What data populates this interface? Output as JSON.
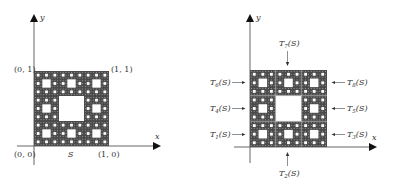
{
  "left_figure": {
    "axis_x_label": "x",
    "axis_y_label": "y",
    "corner_labels": {
      "top_left": "(0, 1)",
      "top_right": "(1, 1)",
      "bottom_left": "(0, 0)",
      "bottom_right": "(1, 0)"
    },
    "set_label": "S",
    "description": "Sierpinski carpet S on unit square"
  },
  "right_figure": {
    "axis_x_label": "x",
    "axis_y_label": "y",
    "transform_labels": [
      {
        "id": "T1",
        "base": "T",
        "sub": "1",
        "arg": "(S)",
        "side": "left",
        "row": "bottom"
      },
      {
        "id": "T2",
        "base": "T",
        "sub": "2",
        "arg": "(S)",
        "side": "bottom",
        "col": "middle"
      },
      {
        "id": "T3",
        "base": "T",
        "sub": "3",
        "arg": "(S)",
        "side": "right",
        "row": "bottom"
      },
      {
        "id": "T4",
        "base": "T",
        "sub": "4",
        "arg": "(S)",
        "side": "left",
        "row": "middle"
      },
      {
        "id": "T5",
        "base": "T",
        "sub": "5",
        "arg": "(S)",
        "side": "right",
        "row": "middle"
      },
      {
        "id": "T6",
        "base": "T",
        "sub": "6",
        "arg": "(S)",
        "side": "left",
        "row": "top"
      },
      {
        "id": "T7",
        "base": "T",
        "sub": "7",
        "arg": "(S)",
        "side": "top",
        "col": "middle"
      },
      {
        "id": "T8",
        "base": "T",
        "sub": "8",
        "arg": "(S)",
        "side": "right",
        "row": "top"
      }
    ],
    "description": "S decomposed into 8 self-similar copies T1(S)..T8(S)"
  },
  "colors": {
    "fractal_fill": "#4a4a4a",
    "hole": "#ffffff",
    "axis": "#555555",
    "text": "#333333"
  }
}
